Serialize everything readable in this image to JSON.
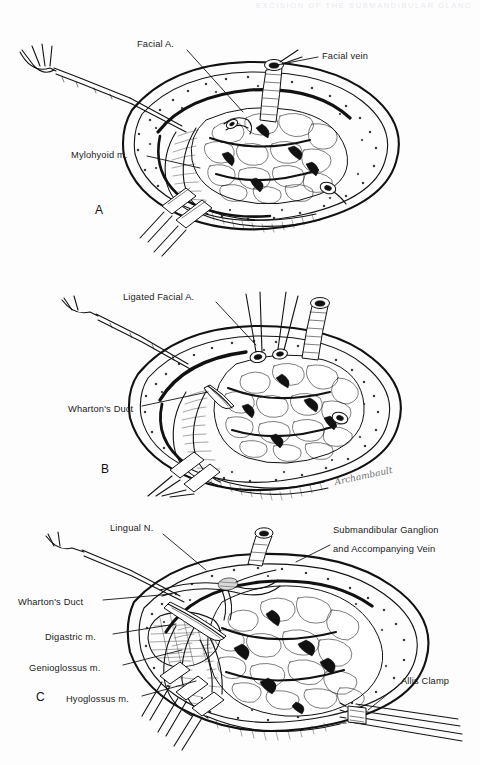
{
  "page": {
    "width": 480,
    "height": 765,
    "background": "#fdfdfd",
    "ink_color": "#111111",
    "running_header": "EXCISION OF THE SUBMANDIBULAR GLAND",
    "artist_signature": "Archambault"
  },
  "figure": {
    "kind": "medical-illustration",
    "style": "pen-and-ink line drawing",
    "panel_count": 3
  },
  "panels": [
    {
      "letter": "A",
      "letter_x": 95,
      "letter_y": 203,
      "caption": "",
      "labels": [
        {
          "text": "Facial A.",
          "x": 137,
          "y": 44,
          "align": "left",
          "leader": [
            [
              187,
              54
            ],
            [
              237,
              110
            ]
          ]
        },
        {
          "text": "Facial vein",
          "x": 322,
          "y": 56,
          "align": "left",
          "leader": [
            [
              318,
              60
            ],
            [
              272,
              67
            ]
          ]
        },
        {
          "text": "Mylohyoid m.",
          "x": 71,
          "y": 155,
          "align": "left",
          "leader": [
            [
              147,
              159
            ],
            [
              196,
              168
            ]
          ]
        }
      ]
    },
    {
      "letter": "B",
      "letter_x": 101,
      "letter_y": 462,
      "caption": "",
      "labels": [
        {
          "text": "Ligated Facial A.",
          "x": 123,
          "y": 297,
          "align": "left",
          "leader": [
            [
              215,
              307
            ],
            [
              255,
              345
            ]
          ]
        },
        {
          "text": "Wharton's Duct",
          "x": 68,
          "y": 409,
          "align": "left",
          "leader": [
            [
              142,
              410
            ],
            [
              205,
              393
            ]
          ]
        }
      ]
    },
    {
      "letter": "C",
      "letter_x": 36,
      "letter_y": 696,
      "caption": "",
      "labels": [
        {
          "text": "Lingual N.",
          "x": 110,
          "y": 528,
          "align": "left",
          "leader": [
            [
              163,
              538
            ],
            [
              203,
              567
            ]
          ]
        },
        {
          "text": "Submandibular Ganglion",
          "x": 333,
          "y": 529,
          "align": "left",
          "leader": [
            [
              328,
              545
            ],
            [
              296,
              561
            ]
          ]
        },
        {
          "text": "and Accompanying Vein",
          "x": 333,
          "y": 548,
          "align": "left",
          "leader": null
        },
        {
          "text": "Wharton's Duct",
          "x": 18,
          "y": 602,
          "align": "left",
          "leader": [
            [
              103,
              604
            ],
            [
              168,
              597
            ]
          ]
        },
        {
          "text": "Digastric m.",
          "x": 45,
          "y": 637,
          "align": "left",
          "leader": [
            [
              113,
              638
            ],
            [
              172,
              628
            ]
          ]
        },
        {
          "text": "Genioglossus m.",
          "x": 29,
          "y": 668,
          "align": "left",
          "leader": [
            [
              122,
              668
            ],
            [
              178,
              654
            ]
          ]
        },
        {
          "text": "Hyoglossus m.",
          "x": 66,
          "y": 699,
          "align": "left",
          "leader": [
            [
              141,
              699
            ],
            [
              192,
              684
            ]
          ]
        },
        {
          "text": "Allis Clamp",
          "x": 401,
          "y": 681,
          "align": "left",
          "leader": [
            [
              398,
              689
            ],
            [
              370,
              712
            ]
          ]
        }
      ]
    }
  ],
  "anatomy_terms": [
    "Facial A.",
    "Facial vein",
    "Mylohyoid m.",
    "Ligated Facial A.",
    "Wharton's Duct",
    "Lingual N.",
    "Submandibular Ganglion and Accompanying Vein",
    "Digastric m.",
    "Genioglossus m.",
    "Hyoglossus m.",
    "Allis Clamp"
  ]
}
